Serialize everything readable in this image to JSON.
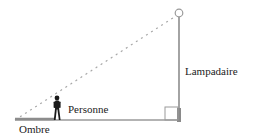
{
  "diagram": {
    "labels": {
      "lamp": "Lampadaire",
      "person": "Personne",
      "shadow": "Ombre"
    },
    "colors": {
      "line": "#9a9a9a",
      "dashed": "#a8a8a8",
      "person": "#1a1a1a",
      "text": "#222222"
    }
  }
}
